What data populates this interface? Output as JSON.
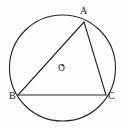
{
  "figure": {
    "background_color": "#fdfdfd",
    "stroke_color": "#2b2b2b",
    "width": 125,
    "height": 130
  },
  "circle": {
    "name": "circumscribed-circle",
    "center_label": "O",
    "center_x": 62.5,
    "center_y": 68,
    "radius": 53
  },
  "points": {
    "A": {
      "label": "A",
      "x": 84,
      "y": 22
    },
    "B": {
      "label": "B",
      "x": 18,
      "y": 95
    },
    "C": {
      "label": "C",
      "x": 106,
      "y": 95
    },
    "O": {
      "label": "O",
      "x": 62.5,
      "y": 68
    }
  },
  "segments": [
    {
      "name": "segment-AB",
      "from": "A",
      "to": "B"
    },
    {
      "name": "segment-AC",
      "from": "A",
      "to": "C"
    },
    {
      "name": "segment-BC",
      "from": "B",
      "to": "C"
    }
  ],
  "labels": {
    "a": "A",
    "b": "B",
    "c": "C",
    "o": "O"
  }
}
